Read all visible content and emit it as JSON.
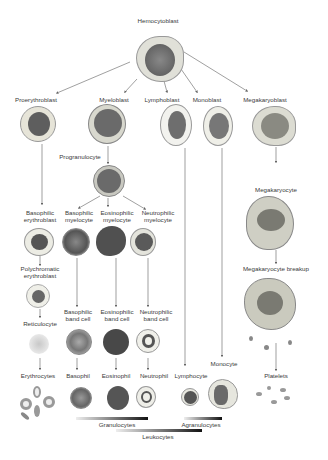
{
  "title": "Hemocytoblast",
  "blasts": [
    "Proerythroblast",
    "Myeloblast",
    "Lymphoblast",
    "Monoblast",
    "Megakaryoblast"
  ],
  "myeloid": {
    "progranulocyte": "Progranulocyte",
    "myelocytes": [
      "Basophilic myelocyte",
      "Eosinophilic myelocyte",
      "Neutrophilic myelocyte"
    ],
    "band_cells": [
      "Basophilic band cell",
      "Eosinophilic band cell",
      "Neutrophilic band cell"
    ],
    "mature": [
      "Basophil",
      "Eosinophil",
      "Neutrophil"
    ]
  },
  "erythroid": {
    "basophilic": "Basophilic erythroblast",
    "polychromatic": "Polychromatic erythroblast",
    "reticulocyte": "Reticulocyte",
    "mature": "Erythrocytes"
  },
  "lymphoid": {
    "mature": "Lymphocyte"
  },
  "monocytic": {
    "mature": "Monocyte"
  },
  "megakaryocytic": {
    "megakaryocyte": "Megakaryocyte",
    "breakup": "Megakaryocyte breakup",
    "mature": "Platelets"
  },
  "groups": {
    "granulocytes": "Granulocytes",
    "agranulocytes": "Agranulocytes",
    "leukocytes": "Leukocytes"
  },
  "colors": {
    "nucleus": "#6a6a6a",
    "cytoplasm": "#d8d8d0",
    "line": "#777777"
  }
}
